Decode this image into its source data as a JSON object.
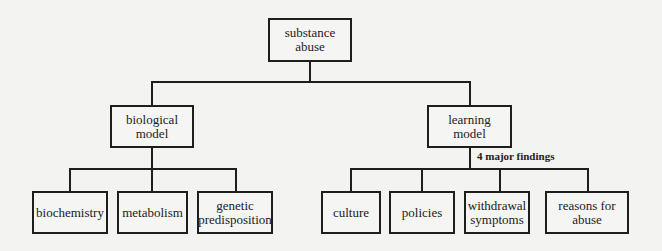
{
  "diagram": {
    "root": {
      "label": "substance\nabuse"
    },
    "branches": [
      {
        "label": "biological\nmodel",
        "children": [
          {
            "label": "biochemistry"
          },
          {
            "label": "metabolism"
          },
          {
            "label": "genetic\npredisposition"
          }
        ]
      },
      {
        "label": "learning\nmodel",
        "annotation": "4 major findings",
        "children": [
          {
            "label": "culture"
          },
          {
            "label": "policies"
          },
          {
            "label": "withdrawal\nsymptoms"
          },
          {
            "label": "reasons for\nabuse"
          }
        ]
      }
    ]
  }
}
